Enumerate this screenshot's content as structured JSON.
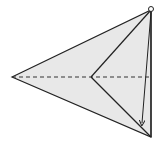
{
  "diagram": {
    "type": "fold-diagram",
    "colors": {
      "fill": "#e8e8e8",
      "stroke": "#222222",
      "dashed": "#333333",
      "background": "#ffffff"
    },
    "points": {
      "top": [
        151,
        10
      ],
      "bottom": [
        151,
        137
      ],
      "left": [
        12,
        77
      ],
      "inner": [
        91,
        77
      ],
      "arrow_end": [
        142,
        124
      ]
    },
    "elements": [
      {
        "name": "outer-kite",
        "kind": "polygon"
      },
      {
        "name": "fold-crease-upper",
        "kind": "line",
        "from": "inner",
        "to": "top"
      },
      {
        "name": "fold-crease-lower",
        "kind": "line",
        "from": "inner",
        "to": "bottom"
      },
      {
        "name": "center-valley-fold",
        "kind": "dashed-line",
        "from": "left",
        "to": "right-edge"
      },
      {
        "name": "fold-arrow",
        "kind": "arrow",
        "from": "top",
        "to": "arrow_end"
      },
      {
        "name": "pivot-circle",
        "kind": "circle",
        "at": "top"
      }
    ]
  }
}
